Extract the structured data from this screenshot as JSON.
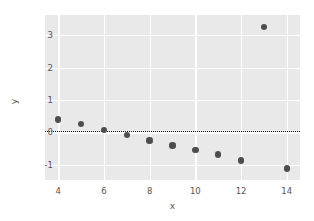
{
  "chart_data": {
    "type": "scatter",
    "title": "",
    "xlabel": "x",
    "ylabel": "y",
    "xlim": [
      3.42,
      14.58
    ],
    "ylim": [
      -1.47,
      3.62
    ],
    "xticks": [
      4,
      6,
      8,
      10,
      12,
      14
    ],
    "yticks": [
      -1,
      0,
      1,
      2,
      3
    ],
    "xticklabels": [
      "4",
      "6",
      "8",
      "10",
      "12",
      "14"
    ],
    "yticklabels": [
      "-1",
      "0",
      "1",
      "2",
      "3"
    ],
    "grid": true,
    "grid_color": "#ffffff",
    "axes_facecolor": "#e9e9e9",
    "figure_facecolor": "#ffffff",
    "legend": null,
    "marker_color": "#4d4d4d",
    "marker_size": 6.4,
    "x": [
      4,
      5,
      6,
      7,
      8,
      9,
      10,
      11,
      12,
      13,
      14
    ],
    "y": [
      0.4,
      0.25,
      0.08,
      -0.09,
      -0.25,
      -0.41,
      -0.55,
      -0.68,
      -0.87,
      3.25,
      -1.12
    ],
    "points": [
      {
        "x": 4,
        "y": 0.4
      },
      {
        "x": 5,
        "y": 0.25
      },
      {
        "x": 6,
        "y": 0.08
      },
      {
        "x": 7,
        "y": -0.09
      },
      {
        "x": 8,
        "y": -0.25
      },
      {
        "x": 9,
        "y": -0.41
      },
      {
        "x": 10,
        "y": -0.55
      },
      {
        "x": 11,
        "y": -0.68
      },
      {
        "x": 12,
        "y": -0.87
      },
      {
        "x": 13,
        "y": 3.25
      },
      {
        "x": 14,
        "y": -1.12
      }
    ],
    "annotations": [
      {
        "type": "hline",
        "y": 0.05,
        "style": "dotted",
        "color": "#1a1a1a"
      }
    ]
  }
}
